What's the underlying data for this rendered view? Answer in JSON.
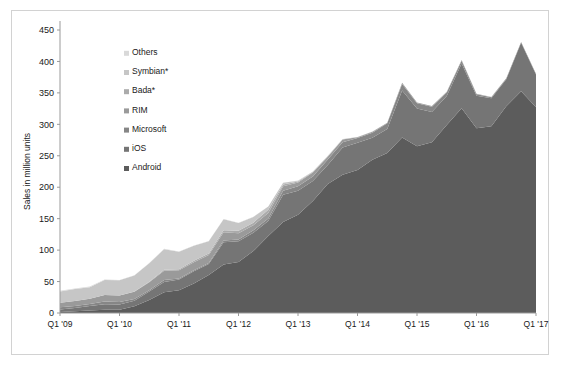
{
  "chart_data": {
    "type": "area",
    "stacked": true,
    "title": "",
    "subtitle": "",
    "xlabel": "",
    "ylabel": "Sales in million units",
    "ylim": [
      0,
      450
    ],
    "ytick_step": 50,
    "yticks": [
      "0",
      "50",
      "100",
      "150",
      "200",
      "250",
      "300",
      "350",
      "400",
      "450"
    ],
    "grid": false,
    "legend_position": "inside-upper-left",
    "x": [
      "Q1 '09",
      "Q2 '09",
      "Q3 '09",
      "Q4 '09",
      "Q1 '10",
      "Q2 '10",
      "Q3 '10",
      "Q4 '10",
      "Q1 '11",
      "Q2 '11",
      "Q3 '11",
      "Q4 '11",
      "Q1 '12",
      "Q2 '12",
      "Q3 '12",
      "Q4 '12",
      "Q1 '13",
      "Q2 '13",
      "Q3 '13",
      "Q4 '13",
      "Q1 '14",
      "Q2 '14",
      "Q3 '14",
      "Q4 '14",
      "Q1 '15",
      "Q2 '15",
      "Q3 '15",
      "Q4 '15",
      "Q1 '16",
      "Q2 '16",
      "Q3 '16",
      "Q4 '16",
      "Q1 '17"
    ],
    "xtick_labels": [
      "Q1 '09",
      "Q1 '10",
      "Q1 '11",
      "Q1 '12",
      "Q1 '13",
      "Q1 '14",
      "Q1 '15",
      "Q1 '16",
      "Q1 '17"
    ],
    "xtick_indices": [
      0,
      4,
      8,
      12,
      16,
      20,
      24,
      28,
      32
    ],
    "series": [
      {
        "name": "Android",
        "color": "#5c5c5c",
        "values": [
          1.6,
          2.8,
          4.0,
          5.2,
          5.2,
          10.6,
          20.5,
          33.1,
          36.3,
          46.8,
          60.5,
          77.0,
          81.1,
          98.5,
          122.5,
          144.7,
          156.2,
          177.9,
          205.0,
          220.0,
          227.5,
          243.5,
          254.4,
          279.0,
          265.0,
          271.6,
          298.8,
          325.4,
          293.8,
          296.9,
          328.6,
          352.7,
          327.2
        ]
      },
      {
        "name": "iOS",
        "color": "#757575",
        "values": [
          3.8,
          5.3,
          7.0,
          8.7,
          8.4,
          8.7,
          13.5,
          16.0,
          16.9,
          19.6,
          17.3,
          35.5,
          33.1,
          29.0,
          23.6,
          43.5,
          38.3,
          31.9,
          30.3,
          43.1,
          43.1,
          35.2,
          38.2,
          74.8,
          60.2,
          48.1,
          46.1,
          71.5,
          51.6,
          44.4,
          43.0,
          77.0,
          51.9
        ]
      },
      {
        "name": "Microsoft",
        "color": "#868686",
        "values": [
          3.8,
          3.1,
          3.3,
          4.2,
          3.7,
          3.1,
          2.2,
          3.4,
          1.6,
          1.7,
          1.7,
          2.8,
          2.7,
          4.1,
          4.1,
          6.2,
          7.0,
          7.4,
          8.9,
          8.6,
          7.6,
          8.1,
          9.0,
          10.4,
          8.3,
          8.2,
          5.9,
          4.4,
          2.4,
          1.9,
          1.1,
          1.1,
          1.0
        ]
      },
      {
        "name": "RIM",
        "color": "#9a9a9a",
        "values": [
          7.2,
          7.8,
          8.5,
          10.5,
          10.6,
          11.2,
          12.5,
          14.8,
          13.0,
          12.7,
          12.7,
          13.2,
          9.9,
          7.9,
          8.9,
          7.3,
          6.2,
          6.2,
          4.4,
          4.1,
          1.3,
          1.5,
          1.0,
          1.8,
          1.3,
          1.1,
          1.0,
          0.9,
          0.7,
          0.4,
          0.4,
          0.2,
          0.2
        ]
      },
      {
        "name": "Bada*",
        "color": "#ababab",
        "values": [
          0.0,
          0.0,
          0.0,
          0.0,
          0.0,
          0.6,
          0.9,
          1.5,
          1.9,
          2.1,
          2.5,
          3.1,
          3.8,
          4.2,
          5.1,
          2.7,
          1.4,
          0.8,
          0.6,
          0.3,
          0.2,
          0.1,
          0.0,
          0.0,
          0.0,
          0.0,
          0.0,
          0.0,
          0.0,
          0.0,
          0.0,
          0.0,
          0.0
        ]
      },
      {
        "name": "Symbian*",
        "color": "#c6c6c6",
        "values": [
          17.8,
          19.2,
          18.3,
          23.9,
          24.1,
          25.4,
          29.5,
          32.6,
          27.6,
          23.9,
          19.5,
          17.5,
          12.5,
          9.1,
          5.0,
          2.6,
          1.3,
          0.7,
          0.5,
          0.2,
          0.1,
          0.1,
          0.0,
          0.0,
          0.0,
          0.0,
          0.0,
          0.0,
          0.0,
          0.0,
          0.0,
          0.0,
          0.0
        ]
      },
      {
        "name": "Others",
        "color": "#d9d9d9",
        "values": [
          1.1,
          0.9,
          0.9,
          0.9,
          0.6,
          0.6,
          0.6,
          0.6,
          0.6,
          0.5,
          0.4,
          0.4,
          0.3,
          0.3,
          0.3,
          0.2,
          0.2,
          0.2,
          0.2,
          0.2,
          0.2,
          0.1,
          0.1,
          0.1,
          0.1,
          0.1,
          0.1,
          0.1,
          0.1,
          0.1,
          0.1,
          0.1,
          0.1
        ]
      }
    ],
    "legend_order": [
      "Others",
      "Symbian*",
      "Bada*",
      "RIM",
      "Microsoft",
      "iOS",
      "Android"
    ]
  },
  "plot": {
    "width": 538,
    "height": 345,
    "margin_left": 48,
    "margin_right": 14,
    "margin_top": 19,
    "margin_bottom": 43
  }
}
